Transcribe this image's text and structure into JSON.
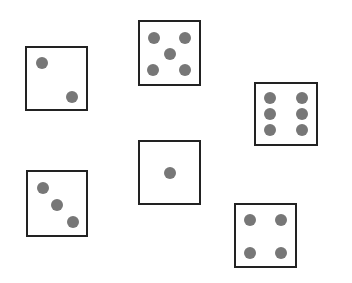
{
  "scene": {
    "description": "Six dice showing faces one through six",
    "pip_color": "#777777",
    "border_color": "#222222",
    "dice": [
      {
        "name": "die-two",
        "value": 2
      },
      {
        "name": "die-five",
        "value": 5
      },
      {
        "name": "die-six",
        "value": 6
      },
      {
        "name": "die-three",
        "value": 3
      },
      {
        "name": "die-one",
        "value": 1
      },
      {
        "name": "die-four",
        "value": 4
      }
    ]
  }
}
